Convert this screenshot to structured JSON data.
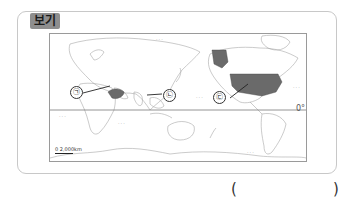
{
  "header": {
    "tag_label": "보기"
  },
  "map": {
    "equator_label": "0°",
    "scale_label": "0  2,000km",
    "ocean_labels": [
      {
        "label": "···",
        "x": 156,
        "y": 36
      },
      {
        "label": "···",
        "x": 293,
        "y": 84
      },
      {
        "label": "···",
        "x": 59,
        "y": 113
      },
      {
        "label": "···",
        "x": 118,
        "y": 120
      },
      {
        "label": "···",
        "x": 196,
        "y": 94
      },
      {
        "label": "···",
        "x": 247,
        "y": 149
      }
    ],
    "markers": [
      {
        "label": "㉠",
        "x": 70,
        "y": 86
      },
      {
        "label": "㉡",
        "x": 163,
        "y": 89
      },
      {
        "label": "㉢",
        "x": 213,
        "y": 91
      }
    ],
    "highlight_color": "#6a6a6a"
  },
  "answer": {
    "open_paren": "(",
    "close_paren": ")",
    "value": ""
  }
}
